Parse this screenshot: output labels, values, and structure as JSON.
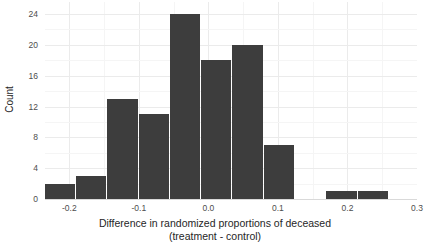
{
  "chart_data": {
    "type": "bar",
    "title": "",
    "xlabel": "Difference in randomized proportions of deceased (treatment - control)",
    "xlabel_line1": "Difference in randomized proportions of deceased",
    "xlabel_line2": "(treatment - control)",
    "ylabel": "Count",
    "bar_color": "#3d3d3d",
    "grid": true,
    "legend": "none",
    "xlim": [
      -0.235,
      0.3
    ],
    "ylim": [
      0,
      24
    ],
    "bin_width": 0.045,
    "categories": [
      "-0.213",
      "-0.168",
      "-0.123",
      "-0.078",
      "-0.033",
      "0.012",
      "0.057",
      "0.102",
      "0.147",
      "0.192",
      "0.237"
    ],
    "bin_edges": [
      -0.2355,
      -0.1905,
      -0.1455,
      -0.1005,
      -0.0555,
      -0.0105,
      0.0345,
      0.0795,
      0.1245,
      0.1695,
      0.2145,
      0.2595
    ],
    "values": [
      2,
      3,
      13,
      11,
      24,
      18,
      20,
      7,
      0,
      1,
      1
    ],
    "x_ticks": [
      -0.2,
      -0.1,
      0.0,
      0.1,
      0.2,
      0.3
    ],
    "x_tick_labels": [
      "-0.2",
      "-0.1",
      "0.0",
      "0.1",
      "0.2",
      "0.3"
    ],
    "y_ticks": [
      0,
      4,
      8,
      12,
      16,
      20,
      24
    ],
    "y_tick_labels": [
      "0",
      "4",
      "8",
      "12",
      "16",
      "20",
      "24"
    ],
    "y_minor_ticks": [
      2,
      6,
      10,
      14,
      18,
      22
    ],
    "x_minor_ticks": [
      -0.15,
      -0.05,
      0.05,
      0.15,
      0.25
    ]
  }
}
